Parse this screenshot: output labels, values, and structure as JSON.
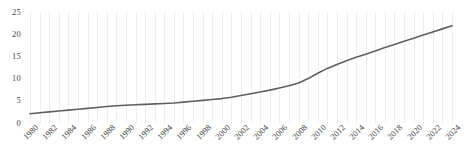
{
  "chart_data": {
    "type": "line",
    "title": "",
    "subtitle": "",
    "xlabel": "",
    "ylabel": "",
    "xlim": [
      1980,
      2024
    ],
    "ylim": [
      0,
      25
    ],
    "yticks": [
      0,
      5,
      10,
      15,
      20,
      25
    ],
    "ytick_labels": [
      "0",
      "5",
      "10",
      "15",
      "20",
      "25"
    ],
    "xticks": [
      1980,
      1982,
      1984,
      1986,
      1988,
      1990,
      1992,
      1994,
      1996,
      1998,
      2000,
      2002,
      2004,
      2006,
      2008,
      2010,
      2012,
      2014,
      2016,
      2018,
      2020,
      2022,
      2024
    ],
    "xtick_labels": [
      "1980",
      "1982",
      "1984",
      "1986",
      "1988",
      "1990",
      "1992",
      "1994",
      "1996",
      "1998",
      "2000",
      "2002",
      "2004",
      "2006",
      "2008",
      "2010",
      "2012",
      "2014",
      "2016",
      "2018",
      "2020",
      "2022",
      "2024"
    ],
    "xtick_rotation": -45,
    "grid": {
      "vertical": true,
      "horizontal": false,
      "color": "#eeeeee",
      "interval_years": 1
    },
    "legend": {
      "visible": false,
      "position": "none"
    },
    "annotations": [],
    "series": [
      {
        "name": "series-1",
        "color": "#5f5f5f",
        "line_width": 1.6,
        "markers": false,
        "x": [
          1980,
          1981,
          1982,
          1983,
          1984,
          1985,
          1986,
          1987,
          1988,
          1989,
          1990,
          1991,
          1992,
          1993,
          1994,
          1995,
          1996,
          1997,
          1998,
          1999,
          2000,
          2001,
          2002,
          2003,
          2004,
          2005,
          2006,
          2007,
          2008,
          2009,
          2010,
          2011,
          2012,
          2013,
          2014,
          2015,
          2016,
          2017,
          2018,
          2019,
          2020,
          2021,
          2022,
          2023,
          2024
        ],
        "y": [
          2.1,
          2.3,
          2.5,
          2.7,
          2.9,
          3.1,
          3.3,
          3.5,
          3.7,
          3.9,
          4.0,
          4.1,
          4.2,
          4.3,
          4.4,
          4.5,
          4.7,
          4.9,
          5.1,
          5.3,
          5.5,
          5.8,
          6.2,
          6.6,
          7.0,
          7.4,
          7.9,
          8.4,
          9.0,
          10.0,
          11.2,
          12.3,
          13.2,
          14.0,
          14.8,
          15.5,
          16.2,
          17.0,
          17.7,
          18.4,
          19.1,
          19.8,
          20.5,
          21.2,
          21.9
        ]
      }
    ]
  }
}
